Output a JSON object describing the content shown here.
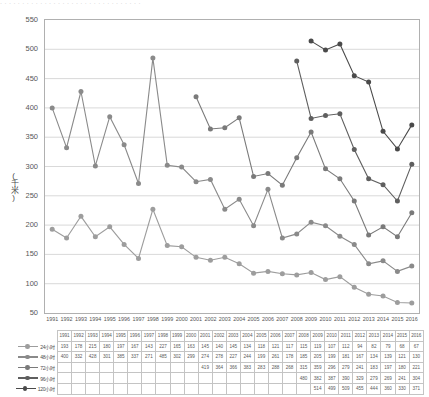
{
  "top_strip_text": "· · · · · · · · · · · · · · · · · · · · · · · · · · · · · · · ·",
  "axis": {
    "y_label": "(千米)",
    "y_ticks": [
      550,
      500,
      450,
      400,
      350,
      300,
      250,
      200,
      150,
      100,
      50
    ],
    "y_min": 50,
    "y_max": 550
  },
  "colors": {
    "series_24h": "#9d9d9d",
    "series_48h": "#8a8a8a",
    "series_72h": "#7a7a7a",
    "series_96h": "#5f5f5f",
    "series_120h": "#4a4a4a",
    "grid": "#c8c8c8",
    "frame": "#b0b0b0",
    "table_border": "#c4c4c4"
  },
  "chart_data": {
    "type": "line",
    "title": "",
    "xlabel": "",
    "ylabel": "(千米)",
    "ylim": [
      50,
      550
    ],
    "grid": true,
    "legend": "table-left",
    "categories": [
      "1991",
      "1992",
      "1993",
      "1994",
      "1995",
      "1996",
      "1997",
      "1998",
      "1999",
      "2000",
      "2001",
      "2002",
      "2003",
      "2004",
      "2005",
      "2006",
      "2007",
      "2008",
      "2009",
      "2010",
      "2011",
      "2012",
      "2013",
      "2014",
      "2015",
      "2016"
    ],
    "series": [
      {
        "name": "24小时",
        "values": [
          193,
          178,
          215,
          180,
          197,
          167,
          143,
          227,
          165,
          163,
          145,
          140,
          145,
          134,
          118,
          121,
          117,
          115,
          119,
          107,
          112,
          94,
          82,
          79,
          68,
          67
        ]
      },
      {
        "name": "48小时",
        "values": [
          400,
          332,
          428,
          301,
          385,
          337,
          271,
          485,
          302,
          299,
          274,
          278,
          227,
          244,
          199,
          261,
          178,
          185,
          205,
          199,
          181,
          167,
          134,
          139,
          121,
          130
        ]
      },
      {
        "name": "72小时",
        "values": [
          null,
          null,
          null,
          null,
          null,
          null,
          null,
          null,
          null,
          null,
          419,
          364,
          366,
          383,
          283,
          288,
          268,
          315,
          359,
          296,
          279,
          241,
          183,
          197,
          180,
          221
        ]
      },
      {
        "name": "96小时",
        "values": [
          null,
          null,
          null,
          null,
          null,
          null,
          null,
          null,
          null,
          null,
          null,
          null,
          null,
          null,
          null,
          null,
          null,
          480,
          382,
          387,
          390,
          329,
          279,
          269,
          241,
          304
        ]
      },
      {
        "name": "120小时",
        "values": [
          null,
          null,
          null,
          null,
          null,
          null,
          null,
          null,
          null,
          null,
          null,
          null,
          null,
          null,
          null,
          null,
          null,
          null,
          514,
          499,
          509,
          455,
          444,
          360,
          330,
          371
        ]
      }
    ]
  },
  "table": {
    "header_blank": "",
    "years": [
      "1991",
      "1992",
      "1993",
      "1994",
      "1995",
      "1996",
      "1997",
      "1998",
      "1999",
      "2000",
      "2001",
      "2002",
      "2003",
      "2004",
      "2005",
      "2006",
      "2007",
      "2008",
      "2009",
      "2010",
      "2011",
      "2012",
      "2013",
      "2014",
      "2015",
      "2016"
    ],
    "rows": [
      {
        "label": "24小时",
        "color": "#9d9d9d",
        "values": [
          "193",
          "178",
          "215",
          "180",
          "197",
          "167",
          "143",
          "227",
          "165",
          "163",
          "145",
          "140",
          "145",
          "134",
          "118",
          "121",
          "117",
          "115",
          "119",
          "107",
          "112",
          "94",
          "82",
          "79",
          "68",
          "67"
        ]
      },
      {
        "label": "48小时",
        "color": "#8a8a8a",
        "values": [
          "400",
          "332",
          "428",
          "301",
          "385",
          "337",
          "271",
          "485",
          "302",
          "299",
          "274",
          "278",
          "227",
          "244",
          "199",
          "261",
          "178",
          "185",
          "205",
          "199",
          "181",
          "167",
          "134",
          "139",
          "121",
          "130"
        ]
      },
      {
        "label": "72小时",
        "color": "#7a7a7a",
        "values": [
          "",
          "",
          "",
          "",
          "",
          "",
          "",
          "",
          "",
          "",
          "419",
          "364",
          "366",
          "383",
          "283",
          "288",
          "268",
          "315",
          "359",
          "296",
          "279",
          "241",
          "183",
          "197",
          "180",
          "221"
        ]
      },
      {
        "label": "96小时",
        "color": "#5f5f5f",
        "values": [
          "",
          "",
          "",
          "",
          "",
          "",
          "",
          "",
          "",
          "",
          "",
          "",
          "",
          "",
          "",
          "",
          "",
          "480",
          "382",
          "387",
          "390",
          "329",
          "279",
          "269",
          "241",
          "304"
        ]
      },
      {
        "label": "120小时",
        "color": "#4a4a4a",
        "values": [
          "",
          "",
          "",
          "",
          "",
          "",
          "",
          "",
          "",
          "",
          "",
          "",
          "",
          "",
          "",
          "",
          "",
          "",
          "514",
          "499",
          "509",
          "455",
          "444",
          "360",
          "330",
          "371"
        ]
      }
    ]
  }
}
